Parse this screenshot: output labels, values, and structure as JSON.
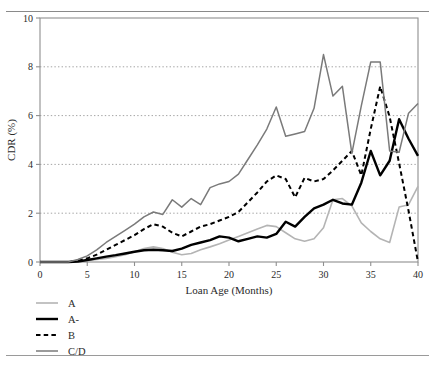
{
  "figure": {
    "header_text": "",
    "background": "#ffffff"
  },
  "axes": {
    "y_title": "CDR (%)",
    "x_title": "Loan Age (Months)",
    "y_ticks": [
      "0",
      "2",
      "4",
      "6",
      "8",
      "10"
    ],
    "x_ticks": [
      "0",
      "5",
      "10",
      "15",
      "20",
      "25",
      "30",
      "35",
      "40"
    ],
    "frame_color": "#8f8f8f",
    "grid_color": "#9a9a9a"
  },
  "legend": {
    "items": [
      {
        "label": "A",
        "color": "#b4b4b4",
        "style": "solid",
        "width": 1.6
      },
      {
        "label": "A-",
        "color": "#000000",
        "style": "solid",
        "width": 2.4
      },
      {
        "label": "B",
        "color": "#000000",
        "style": "dashed",
        "width": 2.0
      },
      {
        "label": "C/D",
        "color": "#7a7a7a",
        "style": "solid",
        "width": 1.5
      }
    ]
  },
  "chart_data": {
    "type": "line",
    "title": "",
    "xlabel": "Loan Age (Months)",
    "ylabel": "CDR (%)",
    "xlim": [
      0,
      40
    ],
    "ylim": [
      0,
      10
    ],
    "xticks": [
      0,
      5,
      10,
      15,
      20,
      25,
      30,
      35,
      40
    ],
    "yticks": [
      0,
      2,
      4,
      6,
      8,
      10
    ],
    "grid": "horizontal-dotted",
    "legend_position": "below-left",
    "x": [
      0,
      1,
      2,
      3,
      4,
      5,
      6,
      7,
      8,
      9,
      10,
      11,
      12,
      13,
      14,
      15,
      16,
      17,
      18,
      19,
      20,
      21,
      22,
      23,
      24,
      25,
      26,
      27,
      28,
      29,
      30,
      31,
      32,
      33,
      34,
      35,
      36,
      37,
      38,
      39,
      40
    ],
    "series": [
      {
        "name": "A",
        "color": "#b4b4b4",
        "style": "solid",
        "values": [
          0,
          0,
          0,
          0,
          0.02,
          0.05,
          0.1,
          0.15,
          0.22,
          0.3,
          0.42,
          0.55,
          0.62,
          0.55,
          0.4,
          0.3,
          0.35,
          0.5,
          0.62,
          0.75,
          0.9,
          1.05,
          1.2,
          1.35,
          1.5,
          1.45,
          1.2,
          0.95,
          0.85,
          0.95,
          1.4,
          2.55,
          2.6,
          2.3,
          1.6,
          1.25,
          0.95,
          0.8,
          2.25,
          2.35,
          3.1
        ]
      },
      {
        "name": "A-",
        "color": "#000000",
        "style": "solid",
        "values": [
          0,
          0,
          0,
          0,
          0.02,
          0.08,
          0.15,
          0.22,
          0.28,
          0.35,
          0.42,
          0.48,
          0.5,
          0.48,
          0.45,
          0.55,
          0.7,
          0.8,
          0.9,
          1.05,
          1.0,
          0.85,
          0.95,
          1.05,
          1.0,
          1.15,
          1.65,
          1.45,
          1.85,
          2.2,
          2.35,
          2.55,
          2.4,
          2.35,
          3.25,
          4.55,
          3.55,
          4.15,
          5.85,
          5.05,
          4.35
        ]
      },
      {
        "name": "B",
        "color": "#000000",
        "style": "dashed",
        "values": [
          0,
          0,
          0,
          0,
          0.05,
          0.15,
          0.3,
          0.5,
          0.7,
          0.9,
          1.1,
          1.35,
          1.55,
          1.45,
          1.2,
          1.05,
          1.25,
          1.45,
          1.55,
          1.7,
          1.85,
          2.05,
          2.45,
          2.85,
          3.3,
          3.55,
          3.4,
          2.65,
          3.45,
          3.3,
          3.4,
          3.75,
          4.15,
          4.55,
          3.55,
          5.45,
          7.2,
          5.95,
          4.05,
          2.1,
          0.0
        ]
      },
      {
        "name": "C/D",
        "color": "#7a7a7a",
        "style": "solid",
        "values": [
          0,
          0,
          0,
          0,
          0.1,
          0.25,
          0.5,
          0.8,
          1.05,
          1.3,
          1.55,
          1.85,
          2.05,
          1.95,
          2.55,
          2.25,
          2.6,
          2.35,
          3.05,
          3.2,
          3.3,
          3.6,
          4.2,
          4.8,
          5.45,
          6.35,
          5.15,
          5.25,
          5.35,
          6.3,
          8.5,
          6.8,
          7.2,
          4.45,
          6.4,
          8.2,
          8.2,
          4.55,
          4.5,
          6.1,
          6.5
        ]
      }
    ]
  }
}
